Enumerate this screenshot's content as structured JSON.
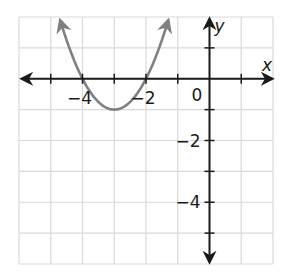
{
  "chart_data": {
    "type": "line",
    "title": "",
    "xlabel": "x",
    "ylabel": "y",
    "xlim": [
      -6,
      2
    ],
    "ylim": [
      -6,
      2
    ],
    "grid": true,
    "grid_step": 1,
    "x_tick_labels": [
      {
        "value": -4,
        "label": "−4"
      },
      {
        "value": -2,
        "label": "−2"
      }
    ],
    "y_tick_labels": [
      {
        "value": -2,
        "label": "−2"
      },
      {
        "value": -4,
        "label": "−4"
      }
    ],
    "origin_label": "0",
    "series": [
      {
        "name": "parabola",
        "equation": "y = (x + 3)^2 - 1",
        "color": "#808080",
        "vertex": [
          -3,
          -1
        ],
        "x_intercepts": [
          -4,
          -2
        ],
        "points": [
          [
            -4.7,
            1.89
          ],
          [
            -4.5,
            1.25
          ],
          [
            -4.25,
            0.5625
          ],
          [
            -4,
            0
          ],
          [
            -3.75,
            -0.4375
          ],
          [
            -3.5,
            -0.75
          ],
          [
            -3.25,
            -0.9375
          ],
          [
            -3,
            -1
          ],
          [
            -2.75,
            -0.9375
          ],
          [
            -2.5,
            -0.75
          ],
          [
            -2.25,
            -0.4375
          ],
          [
            -2,
            0
          ],
          [
            -1.75,
            0.5625
          ],
          [
            -1.5,
            1.25
          ],
          [
            -1.3,
            1.89
          ]
        ],
        "arrows_at_ends": true
      }
    ],
    "colors": {
      "axis": "#1a1a1a",
      "grid": "#d9d9d9",
      "curve": "#808080"
    }
  }
}
